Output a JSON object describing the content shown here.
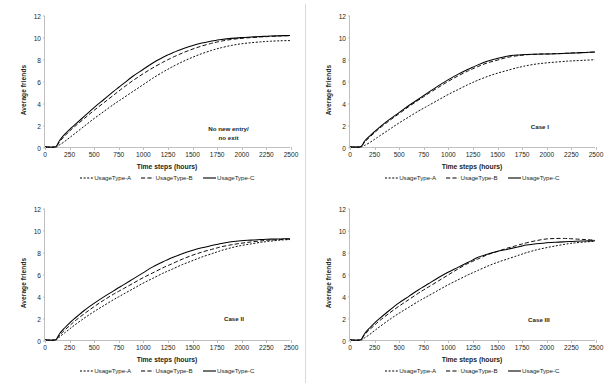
{
  "figure": {
    "title": "",
    "panel_count": 4
  },
  "common": {
    "xlabel": "Time steps (hours)",
    "ylabel": "Average friends",
    "xticks": [
      0,
      250,
      500,
      750,
      1000,
      1250,
      1500,
      1750,
      2000,
      2250,
      2500
    ],
    "yticks": [
      0,
      2,
      4,
      6,
      8,
      10,
      12
    ],
    "legend": [
      {
        "label": "UsageType-A",
        "style": "dotted"
      },
      {
        "label": "UsageType-B",
        "style": "dashed"
      },
      {
        "label": "UsageType-C",
        "style": "solid"
      }
    ],
    "colors": {
      "line": "#000000",
      "axis": "#bfbfbf",
      "text": "#231f20",
      "background": "#ffffff"
    }
  },
  "chart_data": [
    {
      "type": "line",
      "panel": 1,
      "title": "",
      "annotation": "No new entry/\nno exit",
      "annotation_x": 1875,
      "annotation_y": 1.55,
      "xlabel": "Time steps (hours)",
      "ylabel": "Average friends",
      "xlim": [
        0,
        2500
      ],
      "ylim": [
        0,
        12
      ],
      "grid": false,
      "legend_position": "bottom",
      "x": [
        0,
        100,
        125,
        150,
        200,
        250,
        300,
        400,
        500,
        600,
        700,
        750,
        800,
        900,
        1000,
        1100,
        1200,
        1250,
        1300,
        1400,
        1500,
        1600,
        1700,
        1750,
        1800,
        1900,
        2000,
        2100,
        2200,
        2250,
        2300,
        2400,
        2500
      ],
      "series": [
        {
          "name": "UsageType-A",
          "style": "dotted",
          "values": [
            0,
            0,
            0.05,
            0.2,
            0.5,
            0.85,
            1.2,
            1.9,
            2.6,
            3.25,
            3.9,
            4.2,
            4.5,
            5.1,
            5.7,
            6.3,
            6.85,
            7.1,
            7.35,
            7.8,
            8.2,
            8.55,
            8.85,
            8.98,
            9.1,
            9.3,
            9.45,
            9.55,
            9.63,
            9.66,
            9.69,
            9.73,
            9.75
          ]
        },
        {
          "name": "UsageType-B",
          "style": "dashed",
          "values": [
            0,
            0,
            0.15,
            0.5,
            1.0,
            1.45,
            1.85,
            2.6,
            3.35,
            4.05,
            4.75,
            5.1,
            5.45,
            6.1,
            6.7,
            7.25,
            7.75,
            7.98,
            8.2,
            8.6,
            8.95,
            9.25,
            9.5,
            9.6,
            9.7,
            9.85,
            9.95,
            10.02,
            10.08,
            10.1,
            10.13,
            10.17,
            10.2
          ]
        },
        {
          "name": "UsageType-C",
          "style": "solid",
          "values": [
            0,
            0,
            0.2,
            0.62,
            1.15,
            1.6,
            2.0,
            2.8,
            3.6,
            4.35,
            5.1,
            5.45,
            5.8,
            6.5,
            7.1,
            7.7,
            8.2,
            8.42,
            8.62,
            8.98,
            9.28,
            9.52,
            9.7,
            9.78,
            9.85,
            9.95,
            10.02,
            10.07,
            10.12,
            10.14,
            10.16,
            10.19,
            10.22
          ]
        }
      ]
    },
    {
      "type": "line",
      "panel": 2,
      "title": "",
      "annotation": "Case I",
      "annotation_x": 1940,
      "annotation_y": 1.75,
      "xlabel": "Time steps (hours)",
      "ylabel": "Average friends",
      "xlim": [
        0,
        2500
      ],
      "ylim": [
        0,
        12
      ],
      "grid": false,
      "legend_position": "bottom",
      "x": [
        0,
        100,
        125,
        150,
        200,
        250,
        300,
        400,
        500,
        600,
        700,
        750,
        800,
        900,
        1000,
        1100,
        1200,
        1250,
        1300,
        1400,
        1500,
        1600,
        1700,
        1750,
        1800,
        1900,
        2000,
        2100,
        2200,
        2250,
        2300,
        2400,
        2500
      ],
      "series": [
        {
          "name": "UsageType-A",
          "style": "dotted",
          "values": [
            0,
            0,
            0.05,
            0.15,
            0.4,
            0.7,
            1.0,
            1.6,
            2.2,
            2.75,
            3.3,
            3.55,
            3.8,
            4.3,
            4.8,
            5.25,
            5.7,
            5.9,
            6.1,
            6.45,
            6.75,
            7.0,
            7.25,
            7.35,
            7.45,
            7.6,
            7.7,
            7.78,
            7.85,
            7.88,
            7.9,
            7.95,
            8.0
          ]
        },
        {
          "name": "UsageType-B",
          "style": "dashed",
          "values": [
            0,
            0,
            0.15,
            0.45,
            0.9,
            1.3,
            1.7,
            2.4,
            3.05,
            3.7,
            4.3,
            4.6,
            4.9,
            5.45,
            6.0,
            6.5,
            6.95,
            7.15,
            7.35,
            7.7,
            7.95,
            8.2,
            8.35,
            8.4,
            8.45,
            8.5,
            8.52,
            8.55,
            8.58,
            8.6,
            8.62,
            8.65,
            8.7
          ]
        },
        {
          "name": "UsageType-C",
          "style": "solid",
          "values": [
            0,
            0,
            0.18,
            0.55,
            1.0,
            1.4,
            1.8,
            2.5,
            3.15,
            3.8,
            4.4,
            4.7,
            5.0,
            5.6,
            6.15,
            6.65,
            7.1,
            7.3,
            7.5,
            7.85,
            8.1,
            8.32,
            8.42,
            8.46,
            8.48,
            8.5,
            8.52,
            8.54,
            8.58,
            8.6,
            8.62,
            8.66,
            8.7
          ]
        }
      ]
    },
    {
      "type": "line",
      "panel": 3,
      "title": "",
      "annotation": "Case II",
      "annotation_x": 1930,
      "annotation_y": 1.85,
      "xlabel": "Time steps (hours)",
      "ylabel": "Average friends",
      "xlim": [
        0,
        2500
      ],
      "ylim": [
        0,
        12
      ],
      "grid": false,
      "legend_position": "bottom",
      "x": [
        0,
        100,
        125,
        150,
        200,
        250,
        300,
        400,
        500,
        600,
        700,
        750,
        800,
        900,
        1000,
        1100,
        1200,
        1250,
        1300,
        1400,
        1500,
        1600,
        1700,
        1750,
        1800,
        1900,
        2000,
        2100,
        2200,
        2250,
        2300,
        2400,
        2500
      ],
      "series": [
        {
          "name": "UsageType-A",
          "style": "dotted",
          "values": [
            0,
            0,
            0.08,
            0.3,
            0.65,
            1.0,
            1.35,
            2.0,
            2.6,
            3.15,
            3.7,
            3.95,
            4.2,
            4.7,
            5.2,
            5.65,
            6.1,
            6.3,
            6.5,
            6.9,
            7.25,
            7.6,
            7.9,
            8.05,
            8.2,
            8.45,
            8.65,
            8.8,
            8.95,
            9.0,
            9.05,
            9.15,
            9.2
          ]
        },
        {
          "name": "UsageType-B",
          "style": "dashed",
          "values": [
            0,
            0,
            0.15,
            0.45,
            0.9,
            1.3,
            1.7,
            2.4,
            3.05,
            3.65,
            4.2,
            4.45,
            4.7,
            5.2,
            5.7,
            6.15,
            6.6,
            6.8,
            7.0,
            7.4,
            7.75,
            8.05,
            8.3,
            8.42,
            8.54,
            8.72,
            8.86,
            8.98,
            9.08,
            9.12,
            9.15,
            9.2,
            9.25
          ]
        },
        {
          "name": "UsageType-C",
          "style": "solid",
          "values": [
            0,
            0,
            0.2,
            0.6,
            1.1,
            1.55,
            1.95,
            2.7,
            3.35,
            3.95,
            4.5,
            4.78,
            5.05,
            5.6,
            6.15,
            6.7,
            7.15,
            7.35,
            7.55,
            7.9,
            8.2,
            8.45,
            8.65,
            8.75,
            8.85,
            9.0,
            9.1,
            9.15,
            9.2,
            9.22,
            9.24,
            9.26,
            9.28
          ]
        }
      ]
    },
    {
      "type": "line",
      "panel": 4,
      "title": "",
      "annotation": "Case III",
      "annotation_x": 1930,
      "annotation_y": 1.75,
      "xlabel": "Time steps (hours)",
      "ylabel": "Average friends",
      "xlim": [
        0,
        2500
      ],
      "ylim": [
        0,
        12
      ],
      "grid": false,
      "legend_position": "bottom",
      "x": [
        0,
        100,
        125,
        150,
        200,
        250,
        300,
        400,
        500,
        600,
        700,
        750,
        800,
        900,
        1000,
        1100,
        1200,
        1250,
        1300,
        1400,
        1500,
        1600,
        1700,
        1750,
        1800,
        1900,
        2000,
        2100,
        2200,
        2250,
        2300,
        2400,
        2500
      ],
      "series": [
        {
          "name": "UsageType-A",
          "style": "dotted",
          "values": [
            0,
            0,
            0.05,
            0.2,
            0.5,
            0.85,
            1.2,
            1.85,
            2.45,
            3.0,
            3.55,
            3.8,
            4.05,
            4.55,
            5.05,
            5.5,
            5.95,
            6.15,
            6.35,
            6.75,
            7.1,
            7.4,
            7.7,
            7.85,
            8.0,
            8.25,
            8.45,
            8.62,
            8.78,
            8.85,
            8.9,
            8.98,
            9.05
          ]
        },
        {
          "name": "UsageType-B",
          "style": "dashed",
          "values": [
            0,
            0,
            0.15,
            0.5,
            0.95,
            1.35,
            1.75,
            2.45,
            3.1,
            3.7,
            4.3,
            4.58,
            4.85,
            5.4,
            5.95,
            6.5,
            7.0,
            7.2,
            7.4,
            7.8,
            8.1,
            8.4,
            8.65,
            8.78,
            8.9,
            9.1,
            9.25,
            9.3,
            9.3,
            9.28,
            9.25,
            9.2,
            9.15
          ]
        },
        {
          "name": "UsageType-C",
          "style": "solid",
          "values": [
            0,
            0,
            0.2,
            0.6,
            1.1,
            1.55,
            1.95,
            2.7,
            3.4,
            4.0,
            4.6,
            4.88,
            5.15,
            5.7,
            6.2,
            6.65,
            7.1,
            7.32,
            7.55,
            7.85,
            8.1,
            8.3,
            8.5,
            8.6,
            8.7,
            8.82,
            8.9,
            8.96,
            9.0,
            9.02,
            9.04,
            9.07,
            9.1
          ]
        }
      ]
    }
  ]
}
